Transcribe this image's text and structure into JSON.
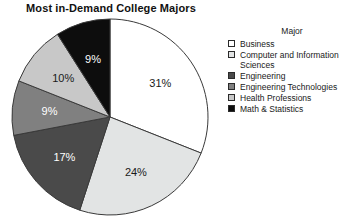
{
  "chart_data": {
    "type": "pie",
    "title": "Most in-Demand College Majors",
    "legend_title": "Major",
    "legend_position": "right",
    "start_angle_deg": 0,
    "direction": "clockwise",
    "categories": [
      "Business",
      "Computer and Information Sciences",
      "Engineering",
      "Engineering Technologies",
      "Health Professions",
      "Math & Statistics"
    ],
    "values": [
      31,
      24,
      17,
      9,
      10,
      9
    ],
    "value_labels": [
      "31%",
      "24%",
      "17%",
      "9%",
      "10%",
      "9%"
    ],
    "slice_colors": [
      "#ffffff",
      "#e2e4e4",
      "#4a4a4a",
      "#808080",
      "#c8c8c8",
      "#0d0d0d"
    ],
    "slice_label_colors": [
      "#1a1a1a",
      "#1a1a1a",
      "#ffffff",
      "#ffffff",
      "#1a1a1a",
      "#ffffff"
    ],
    "outline_color": "#3a3a3a",
    "xlabel": "",
    "ylabel": ""
  },
  "legend": {
    "title": "Major",
    "items": [
      {
        "label": "Business",
        "color": "#ffffff"
      },
      {
        "label": "Computer and Information\nSciences",
        "color": "#e2e4e4"
      },
      {
        "label": "Engineering",
        "color": "#4a4a4a"
      },
      {
        "label": "Engineering Technologies",
        "color": "#808080"
      },
      {
        "label": "Health Professions",
        "color": "#c8c8c8"
      },
      {
        "label": "Math & Statistics",
        "color": "#0d0d0d"
      }
    ]
  }
}
